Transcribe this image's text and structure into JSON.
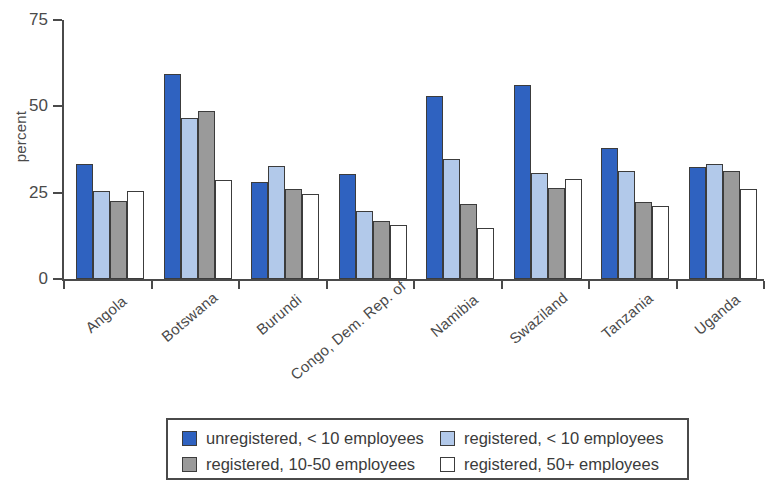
{
  "chart_data": {
    "type": "bar",
    "title": "",
    "xlabel": "",
    "ylabel": "percent",
    "ylim": [
      0,
      75
    ],
    "yticks": [
      0,
      25,
      50,
      75
    ],
    "ytick_labels": [
      "0",
      "25",
      "50",
      "75"
    ],
    "grid": false,
    "legend_position": "bottom",
    "categories": [
      "Angola",
      "Botswana",
      "Burundi",
      "Congo, Dem. Rep. of",
      "Namibia",
      "Swaziland",
      "Tanzania",
      "Uganda"
    ],
    "series": [
      {
        "name": "unregistered, < 10 employees",
        "color": "#2f62c0",
        "values": [
          33.2,
          59.4,
          28.2,
          30.4,
          52.9,
          56.2,
          38.0,
          32.4
        ]
      },
      {
        "name": "registered, < 10 employees",
        "color": "#b2c9ea",
        "values": [
          25.6,
          46.6,
          32.7,
          19.8,
          34.7,
          30.8,
          31.2,
          33.2
        ]
      },
      {
        "name": "registered, 10-50 employees",
        "color": "#9a9a9a",
        "values": [
          22.5,
          48.7,
          26.2,
          16.8,
          21.7,
          26.5,
          22.2,
          31.3
        ]
      },
      {
        "name": "registered, 50+ employees",
        "color": "#ffffff",
        "values": [
          25.4,
          28.6,
          24.7,
          15.6,
          14.7,
          29.0,
          21.0,
          26.2
        ]
      }
    ]
  },
  "axes": {
    "y_title": "percent"
  },
  "legend": {
    "items": [
      {
        "label": "unregistered, < 10 employees",
        "swatch": "s0"
      },
      {
        "label": "registered, < 10 employees",
        "swatch": "s1"
      },
      {
        "label": "registered, 10-50 employees",
        "swatch": "s2"
      },
      {
        "label": "registered, 50+ employees",
        "swatch": "s3"
      }
    ]
  }
}
